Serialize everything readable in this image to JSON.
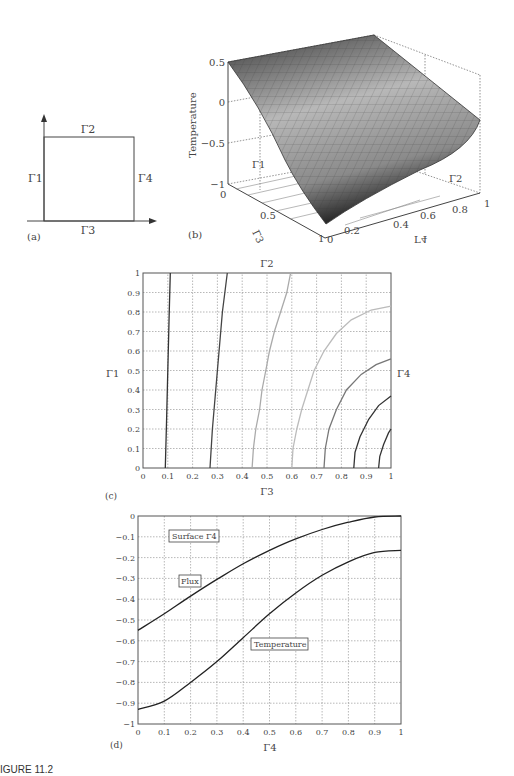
{
  "figure_caption": "IGURE 11.2",
  "panel_a": {
    "label": "(a)",
    "edges": {
      "top": "Γ2",
      "left": "Γ1",
      "right": "Γ4",
      "bottom": "Γ3"
    }
  },
  "panel_b": {
    "label": "(b)",
    "zlabel": "Temperature",
    "zticks": [
      "0.5",
      "0",
      "−0.5",
      "−1"
    ],
    "gamma3_ticks": [
      "0",
      "0.5",
      "1"
    ],
    "gamma4_ticks": [
      "0",
      "0.2",
      "0.4",
      "0.6",
      "0.8",
      "1"
    ],
    "gamma3_label": "Γ3",
    "gamma4_label": "Γ4",
    "gamma1_label": "Γ1",
    "gamma2_label": "Γ2"
  },
  "panel_c": {
    "label": "(c)",
    "top_label": "Γ2",
    "left_label": "Γ1",
    "right_label": "Γ4",
    "xlabel": "Γ3",
    "xticks": [
      "0",
      "0.1",
      "0.2",
      "0.3",
      "0.4",
      "0.5",
      "0.6",
      "0.7",
      "0.8",
      "0.9",
      "1"
    ],
    "yticks": [
      "0",
      "0.1",
      "0.2",
      "0.3",
      "0.4",
      "0.5",
      "0.6",
      "0.7",
      "0.8",
      "0.9",
      "1"
    ]
  },
  "panel_d": {
    "label": "(d)",
    "xlabel": "Γ4",
    "annotation_surface": "Surface Γ4",
    "annotation_flux": "Flux",
    "annotation_temperature": "Temperature",
    "xticks": [
      "0",
      "0.1",
      "0.2",
      "0.3",
      "0.4",
      "0.5",
      "0.6",
      "0.7",
      "0.8",
      "0.9",
      "1"
    ],
    "yticks": [
      "0",
      "−0.1",
      "−0.2",
      "−0.3",
      "−0.4",
      "−0.5",
      "−0.6",
      "−0.7",
      "−0.8",
      "−0.9",
      "−1"
    ]
  },
  "chart_data": [
    {
      "panel": "a",
      "type": "diagram",
      "title": "Square domain with boundaries",
      "boundaries": [
        "Γ1 (left)",
        "Γ2 (top)",
        "Γ3 (bottom)",
        "Γ4 (right)"
      ]
    },
    {
      "panel": "b",
      "type": "surface",
      "zlabel": "Temperature",
      "zlim": [
        -1,
        0.5
      ],
      "axes": {
        "Γ3": [
          0,
          1
        ],
        "Γ4": [
          0,
          1
        ]
      },
      "description": "Temperature surface, ~0.5 along far edge (Γ1 side), falling to ~-0.93 near corner Γ3=1, Γ4=0",
      "corner_values": {
        "Γ3=0,Γ4=0": 0.5,
        "Γ3=0,Γ4=1": 0.5,
        "Γ3=1,Γ4=1": -0.17,
        "Γ3=1,Γ4=0": -0.93
      }
    },
    {
      "panel": "c",
      "type": "contour",
      "xlabel": "Γ3",
      "ylabel": "Γ1",
      "xlim": [
        0,
        1
      ],
      "ylim": [
        0,
        1
      ],
      "grid": true,
      "contours": [
        {
          "shade": "#333333",
          "points": [
            [
              0.09,
              0
            ],
            [
              0.095,
              0.25
            ],
            [
              0.1,
              0.5
            ],
            [
              0.105,
              0.75
            ],
            [
              0.11,
              1
            ]
          ]
        },
        {
          "shade": "#444444",
          "points": [
            [
              0.27,
              0
            ],
            [
              0.28,
              0.2
            ],
            [
              0.29,
              0.35
            ],
            [
              0.3,
              0.5
            ],
            [
              0.31,
              0.65
            ],
            [
              0.32,
              0.8
            ],
            [
              0.34,
              1
            ]
          ]
        },
        {
          "shade": "#aaaaaa",
          "points": [
            [
              0.44,
              0
            ],
            [
              0.445,
              0.1
            ],
            [
              0.455,
              0.2
            ],
            [
              0.47,
              0.3
            ],
            [
              0.48,
              0.4
            ],
            [
              0.495,
              0.5
            ],
            [
              0.51,
              0.6
            ],
            [
              0.53,
              0.7
            ],
            [
              0.555,
              0.8
            ],
            [
              0.58,
              0.9
            ],
            [
              0.595,
              1
            ]
          ]
        },
        {
          "shade": "#bbbbbb",
          "points": [
            [
              0.6,
              0
            ],
            [
              0.605,
              0.1
            ],
            [
              0.62,
              0.2
            ],
            [
              0.64,
              0.3
            ],
            [
              0.665,
              0.4
            ],
            [
              0.69,
              0.5
            ],
            [
              0.73,
              0.6
            ],
            [
              0.78,
              0.69
            ],
            [
              0.84,
              0.76
            ],
            [
              0.92,
              0.81
            ],
            [
              1,
              0.83
            ]
          ]
        },
        {
          "shade": "#777777",
          "points": [
            [
              0.73,
              0
            ],
            [
              0.735,
              0.1
            ],
            [
              0.75,
              0.2
            ],
            [
              0.78,
              0.3
            ],
            [
              0.82,
              0.4
            ],
            [
              0.88,
              0.48
            ],
            [
              0.94,
              0.53
            ],
            [
              1,
              0.56
            ]
          ]
        },
        {
          "shade": "#333333",
          "points": [
            [
              0.85,
              0
            ],
            [
              0.855,
              0.08
            ],
            [
              0.875,
              0.16
            ],
            [
              0.91,
              0.25
            ],
            [
              0.95,
              0.32
            ],
            [
              1,
              0.37
            ]
          ]
        },
        {
          "shade": "#333333",
          "points": [
            [
              0.95,
              0
            ],
            [
              0.955,
              0.06
            ],
            [
              0.97,
              0.12
            ],
            [
              0.99,
              0.18
            ],
            [
              1,
              0.2
            ]
          ]
        }
      ]
    },
    {
      "panel": "d",
      "type": "line",
      "title": "Surface Γ4",
      "xlabel": "Γ4",
      "ylabel": "",
      "xlim": [
        0,
        1
      ],
      "ylim": [
        -1,
        0
      ],
      "grid": true,
      "x": [
        0,
        0.1,
        0.2,
        0.3,
        0.4,
        0.5,
        0.6,
        0.7,
        0.8,
        0.9,
        1
      ],
      "series": [
        {
          "name": "Flux",
          "values": [
            -0.55,
            -0.47,
            -0.385,
            -0.305,
            -0.23,
            -0.165,
            -0.11,
            -0.065,
            -0.03,
            -0.005,
            0
          ]
        },
        {
          "name": "Temperature",
          "values": [
            -0.93,
            -0.89,
            -0.8,
            -0.7,
            -0.585,
            -0.47,
            -0.37,
            -0.285,
            -0.22,
            -0.175,
            -0.165
          ]
        }
      ]
    }
  ]
}
